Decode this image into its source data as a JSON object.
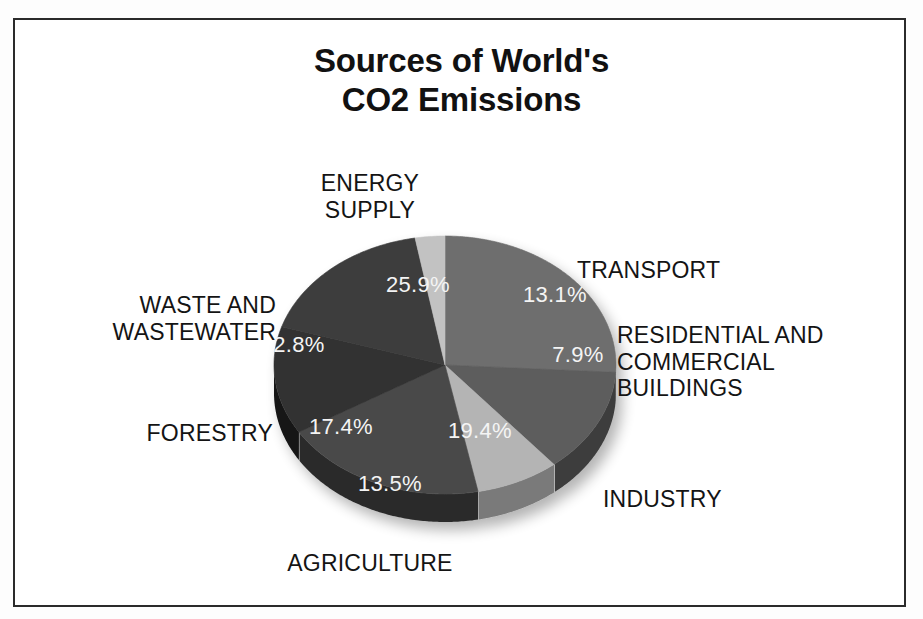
{
  "figure": {
    "title_line1": "Sources of World's",
    "title_line2": "CO2 Emissions",
    "title": "Sources of World's\nCO2 Emissions",
    "frame_color": "#2b2b2b",
    "background_color": "#ffffff"
  },
  "labels": {
    "energy_supply": "ENERGY\nSUPPLY",
    "transport": "TRANSPORT",
    "residential": "RESIDENTIAL AND\nCOMMERCIAL\nBUILDINGS",
    "industry": "INDUSTRY",
    "agriculture": "AGRICULTURE",
    "forestry": "FORESTRY",
    "waste": "WASTE AND\nWASTEWATER"
  },
  "percent_labels": {
    "energy_supply": "25.9%",
    "transport": "13.1%",
    "residential": "7.9%",
    "industry": "19.4%",
    "agriculture": "13.5%",
    "forestry": "17.4%",
    "waste": "2.8%"
  },
  "chart_data": {
    "type": "pie",
    "title": "Sources of World's CO2 Emissions",
    "subtitle": "",
    "xlabel": "",
    "ylabel": "",
    "three_d": true,
    "legend": "none",
    "value_unit": "percent",
    "start_angle_deg": -90,
    "direction": "clockwise",
    "labels": [
      "ENERGY SUPPLY",
      "TRANSPORT",
      "RESIDENTIAL AND COMMERCIAL BUILDINGS",
      "INDUSTRY",
      "AGRICULTURE",
      "FORESTRY",
      "WASTE AND WASTEWATER"
    ],
    "values": [
      25.9,
      13.1,
      7.9,
      19.4,
      13.5,
      17.4,
      2.8
    ],
    "value_labels": [
      "25.9%",
      "13.1%",
      "7.9%",
      "19.4%",
      "13.5%",
      "17.4%",
      "2.8%"
    ],
    "colors": [
      "#6e6e6e",
      "#5d5d5d",
      "#b4b4b4",
      "#4a4a4a",
      "#303030",
      "#3c3c3c",
      "#c2c2c2"
    ],
    "side_colors": [
      "#4a4a4a",
      "#3e3e3e",
      "#7a7a7a",
      "#2b2b2b",
      "#151515",
      "#222222",
      "#8a8a8a"
    ],
    "slices": [
      {
        "label": "ENERGY SUPPLY",
        "value": 25.9,
        "value_label": "25.9%",
        "color": "#6e6e6e",
        "side_color": "#4a4a4a"
      },
      {
        "label": "TRANSPORT",
        "value": 13.1,
        "value_label": "13.1%",
        "color": "#5d5d5d",
        "side_color": "#3e3e3e"
      },
      {
        "label": "RESIDENTIAL AND COMMERCIAL BUILDINGS",
        "value": 7.9,
        "value_label": "7.9%",
        "color": "#b4b4b4",
        "side_color": "#7a7a7a"
      },
      {
        "label": "INDUSTRY",
        "value": 19.4,
        "value_label": "19.4%",
        "color": "#4a4a4a",
        "side_color": "#2b2b2b"
      },
      {
        "label": "AGRICULTURE",
        "value": 13.5,
        "value_label": "13.5%",
        "color": "#303030",
        "side_color": "#151515"
      },
      {
        "label": "FORESTRY",
        "value": 17.4,
        "value_label": "17.4%",
        "color": "#3c3c3c",
        "side_color": "#222222"
      },
      {
        "label": "WASTE AND WASTEWATER",
        "value": 2.8,
        "value_label": "2.8%",
        "color": "#c2c2c2",
        "side_color": "#8a8a8a"
      }
    ],
    "total": 100.0
  }
}
